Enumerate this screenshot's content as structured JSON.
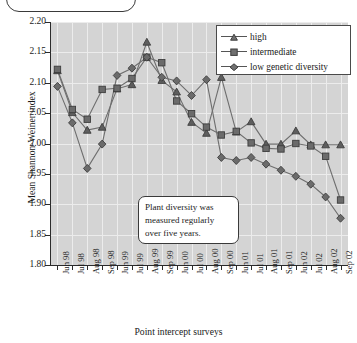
{
  "chart_data": {
    "type": "line",
    "title": "",
    "xlabel": "Point intercept surveys",
    "ylabel": "Mean Shannon-Weiner index",
    "ylim": [
      1.8,
      2.2
    ],
    "yticks": [
      "2.20",
      "2.15",
      "2.10",
      "2.05",
      "2.00",
      "1.95",
      "1.90",
      "1.85",
      "1.80"
    ],
    "ytick_values": [
      2.2,
      2.15,
      2.1,
      2.05,
      2.0,
      1.95,
      1.9,
      1.85,
      1.8
    ],
    "grid": true,
    "legend_position": "top-right",
    "categories": [
      "Jun 98",
      "Jul 98",
      "Aug 98",
      "Sep 98",
      "Jun 99",
      "Jul 99",
      "Aug 99",
      "Sep 99",
      "Jun 00",
      "Jul 00",
      "Aug 00",
      "Sep 00",
      "Jun 01",
      "Jul 01",
      "Aug 01",
      "Sep 01",
      "Jun 02",
      "Jul 02",
      "Aug 02",
      "Sep 02"
    ],
    "series": [
      {
        "name": "high",
        "marker": "triangle",
        "color": "#5e5e5e",
        "values": [
          2.12,
          2.051,
          2.022,
          2.027,
          2.09,
          2.097,
          2.167,
          2.104,
          2.085,
          2.035,
          2.017,
          2.109,
          2.019,
          2.036,
          1.999,
          1.999,
          2.021,
          1.998,
          1.998,
          1.998
        ]
      },
      {
        "name": "intermediate",
        "marker": "square",
        "color": "#6b6b6b",
        "values": [
          2.122,
          2.056,
          2.04,
          2.089,
          2.091,
          2.107,
          2.142,
          2.133,
          2.07,
          2.049,
          2.027,
          2.014,
          2.02,
          2.001,
          1.992,
          1.991,
          2.0,
          1.996,
          1.979,
          1.907
        ]
      },
      {
        "name": "low genetic diversity",
        "marker": "diamond",
        "color": "#6b6b6b",
        "values": [
          2.094,
          2.034,
          1.959,
          1.999,
          2.112,
          2.124,
          2.142,
          2.109,
          2.103,
          2.079,
          2.105,
          1.977,
          1.972,
          1.977,
          1.966,
          1.956,
          1.946,
          1.933,
          1.912,
          1.877
        ]
      }
    ],
    "annotation": {
      "line1": "Plant diversity was",
      "line2": "measured regularly",
      "line3": "over five years."
    }
  },
  "legend": {
    "items": [
      {
        "label": "high"
      },
      {
        "label": "intermediate"
      },
      {
        "label": "low genetic diversity"
      }
    ]
  }
}
